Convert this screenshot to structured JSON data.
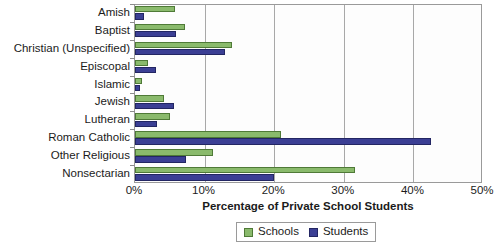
{
  "chart_data": {
    "type": "bar",
    "orientation": "horizontal",
    "title": "",
    "xlabel": "Percentage of Private School Students",
    "ylabel": "",
    "xlim": [
      0,
      50
    ],
    "xticks": [
      "0%",
      "10%",
      "20%",
      "30%",
      "40%",
      "50%"
    ],
    "xtick_values": [
      0,
      10,
      20,
      30,
      40,
      50
    ],
    "grid": true,
    "grid_axis": "x",
    "legend_position": "bottom-center",
    "categories": [
      "Amish",
      "Baptist",
      "Christian (Unspecified)",
      "Episcopal",
      "Islamic",
      "Jewish",
      "Lutheran",
      "Roman Catholic",
      "Other Religious",
      "Nonsectarian"
    ],
    "series": [
      {
        "name": "Schools",
        "color": "#8aba6c",
        "edge_color": "#4f7a37",
        "values": [
          5.8,
          7.2,
          14.0,
          1.9,
          1.0,
          4.2,
          5.0,
          21.0,
          11.2,
          31.6
        ]
      },
      {
        "name": "Students",
        "color": "#3b3f94",
        "edge_color": "#232663",
        "values": [
          1.3,
          5.9,
          13.0,
          3.0,
          0.7,
          5.6,
          3.2,
          42.5,
          7.3,
          20.0
        ]
      }
    ]
  },
  "legend": {
    "entries": [
      {
        "label": "Schools"
      },
      {
        "label": "Students"
      }
    ]
  }
}
